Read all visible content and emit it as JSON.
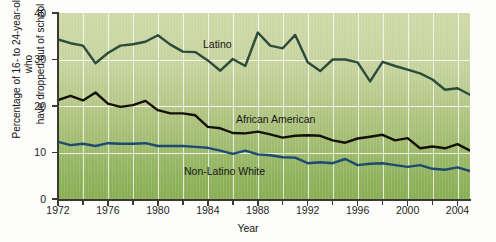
{
  "chart_data": {
    "type": "line",
    "title": "",
    "xlabel": "Year",
    "ylabel": "Percentage of 16- to 24-year-olds who have dropped out of school",
    "ylabel_line1": "Percentage of 16- to 24-year-olds who",
    "ylabel_line2": "have dropped out of school",
    "xlim": [
      1972,
      2005
    ],
    "ylim": [
      0,
      40
    ],
    "yticks": [
      0,
      10,
      20,
      30,
      40
    ],
    "ytick_labels": [
      "0",
      "10",
      "20",
      "30",
      "40"
    ],
    "xticks": [
      1972,
      1974,
      1976,
      1978,
      1980,
      1982,
      1984,
      1986,
      1988,
      1990,
      1992,
      1994,
      1996,
      1998,
      2000,
      2002,
      2004
    ],
    "xtick_labels_shown": [
      "1972",
      "1976",
      "1980",
      "1984",
      "1988",
      "1992",
      "1996",
      "2000",
      "2004"
    ],
    "grid": "vertical gridlines every 2 years, horizontal gridline at 10, 20, 30",
    "legend_position": "inline-labels",
    "x": [
      1972,
      1973,
      1974,
      1975,
      1976,
      1977,
      1978,
      1979,
      1980,
      1981,
      1982,
      1983,
      1984,
      1985,
      1986,
      1987,
      1988,
      1989,
      1990,
      1991,
      1992,
      1993,
      1994,
      1995,
      1996,
      1997,
      1998,
      1999,
      2000,
      2001,
      2002,
      2003,
      2004,
      2005
    ],
    "series": [
      {
        "name": "Latino",
        "color": "#2c4c3b",
        "values": [
          34.3,
          33.5,
          33.0,
          29.2,
          31.4,
          33.0,
          33.3,
          33.8,
          35.2,
          33.2,
          31.7,
          31.6,
          29.8,
          27.6,
          30.1,
          28.6,
          35.8,
          33.0,
          32.4,
          35.3,
          29.4,
          27.5,
          30.0,
          30.0,
          29.4,
          25.3,
          29.5,
          28.6,
          27.8,
          27.0,
          25.7,
          23.5,
          23.8,
          22.4
        ]
      },
      {
        "name": "African American",
        "color": "#141208",
        "values": [
          21.3,
          22.2,
          21.2,
          22.9,
          20.5,
          19.8,
          20.2,
          21.1,
          19.1,
          18.4,
          18.4,
          18.0,
          15.5,
          15.2,
          14.2,
          14.1,
          14.5,
          13.9,
          13.2,
          13.6,
          13.7,
          13.6,
          12.6,
          12.1,
          13.0,
          13.4,
          13.8,
          12.6,
          13.1,
          10.9,
          11.3,
          10.9,
          11.8,
          10.4
        ]
      },
      {
        "name": "Non-Latino White",
        "color": "#1d4a72",
        "values": [
          12.3,
          11.6,
          11.9,
          11.4,
          12.0,
          11.9,
          11.9,
          12.0,
          11.4,
          11.4,
          11.4,
          11.2,
          11.0,
          10.4,
          9.7,
          10.4,
          9.6,
          9.4,
          9.0,
          8.9,
          7.7,
          7.9,
          7.7,
          8.6,
          7.3,
          7.6,
          7.7,
          7.3,
          6.9,
          7.3,
          6.5,
          6.3,
          6.8,
          6.0
        ]
      }
    ]
  },
  "labels": {
    "latino": "Latino",
    "african_american": "African American",
    "non_latino_white": "Non-Latino White"
  },
  "axis": {
    "x_title": "Year",
    "y_title_line1": "Percentage of 16- to 24-year-olds who",
    "y_title_line2": "have dropped out of school",
    "y_ticks": [
      "0",
      "10",
      "20",
      "30",
      "40"
    ],
    "x_ticks": [
      "1972",
      "1976",
      "1980",
      "1984",
      "1988",
      "1992",
      "1996",
      "2000",
      "2004"
    ]
  },
  "colors": {
    "latino_line": "#2c4c3b",
    "african_american_line": "#141208",
    "non_latino_white_line": "#1d4a72",
    "plot_background_top": "#cfd9a8",
    "plot_background_bottom": "#89ae55",
    "gridline": "#ffffff",
    "axis": "#3a3a32"
  }
}
